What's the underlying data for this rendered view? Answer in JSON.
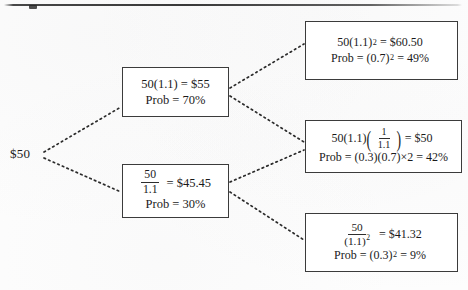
{
  "diagram": {
    "type": "binomial-lattice-tree",
    "title": "",
    "root": {
      "label": "$50",
      "value": 50
    },
    "nodes": [
      {
        "id": "up",
        "position": "middle-upper",
        "value_text": "50(1.1) = $55",
        "value": 55,
        "prob_text": "Prob = 70%",
        "probability": 0.7
      },
      {
        "id": "down",
        "position": "middle-lower",
        "value_numerator": "50",
        "value_denominator": "1.1",
        "value_result": "= $45.45",
        "value": 45.45,
        "prob_text": "Prob = 30%",
        "probability": 0.3
      },
      {
        "id": "up-up",
        "position": "right-top",
        "value_base": "50(1.1)",
        "value_exponent": "2",
        "value_result": "= $60.50",
        "value": 60.5,
        "prob_prefix": "Prob =",
        "prob_base": "(0.7)",
        "prob_exponent": "2",
        "prob_result": "= 49%",
        "probability": 0.49
      },
      {
        "id": "up-down",
        "position": "right-middle",
        "value_prefix": "50(1.1)",
        "value_fraction_numerator": "1",
        "value_fraction_denominator": "1.1",
        "value_result": "= $50",
        "value": 50,
        "prob_text": "Prob = (0.3)(0.7)×2 = 42%",
        "prob_prefix": "Prob =",
        "prob_terms": "(0.3)(0.7)",
        "prob_multiplier": "× 2",
        "prob_result": "= 42%",
        "probability": 0.42
      },
      {
        "id": "down-down",
        "position": "right-bottom",
        "value_numerator": "50",
        "value_denominator_base": "(1.1)",
        "value_denominator_exponent": "2",
        "value_result": "= $41.32",
        "value": 41.32,
        "prob_prefix": "Prob =",
        "prob_base": "(0.3)",
        "prob_exponent": "2",
        "prob_result": "= 9%",
        "probability": 0.09
      }
    ],
    "edges": [
      {
        "from": "root",
        "to": "up",
        "style": "dashed"
      },
      {
        "from": "root",
        "to": "down",
        "style": "dashed"
      },
      {
        "from": "up",
        "to": "up-up",
        "style": "dashed"
      },
      {
        "from": "up",
        "to": "up-down",
        "style": "dashed"
      },
      {
        "from": "down",
        "to": "up-down",
        "style": "dashed"
      },
      {
        "from": "down",
        "to": "down-down",
        "style": "dashed"
      }
    ],
    "colors": {
      "ink": "#1a1a1a",
      "box_border": "#3b3b3b",
      "edge": "#2b2b2b",
      "background": "#fdfdfd"
    }
  }
}
